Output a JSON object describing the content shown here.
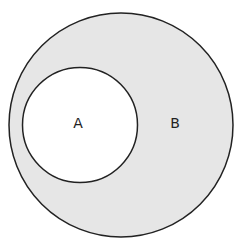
{
  "diagram": {
    "type": "venn-subset",
    "outer_set": {
      "label": "B",
      "fill": "#e6e6e6",
      "stroke": "#222222"
    },
    "inner_set": {
      "label": "A",
      "fill": "#ffffff",
      "stroke": "#222222"
    }
  }
}
